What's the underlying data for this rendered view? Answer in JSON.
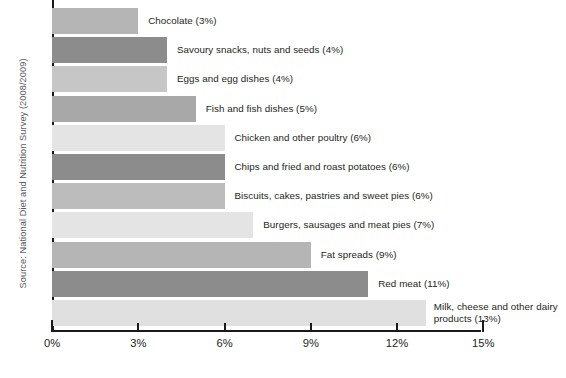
{
  "source_note": "Source: National Diet and Nutrition Survey (2008/2009)",
  "axis": {
    "tick_labels": [
      "0%",
      "3%",
      "6%",
      "9%",
      "12%",
      "15%"
    ]
  },
  "colors": {
    "bar_light": "#e8e8e8",
    "bar_medium": "#b5b5b5",
    "bar_dark": "#8c8c8c",
    "axis": "#1a1a1a",
    "text": "#231f20",
    "source_text": "#58595b",
    "background": "#ffffff"
  },
  "chart_data": {
    "type": "bar",
    "title": "",
    "subtitle": "",
    "xlabel": "",
    "ylabel": "",
    "orientation": "horizontal",
    "xlim": [
      0,
      15
    ],
    "grid": false,
    "legend": false,
    "tick_values": [
      0,
      3,
      6,
      9,
      12,
      15
    ],
    "tick_labels": [
      "0%",
      "3%",
      "6%",
      "9%",
      "12%",
      "15%"
    ],
    "categories": [
      "Chocolate",
      "Savoury snacks, nuts and seeds",
      "Eggs and egg dishes",
      "Fish and fish dishes",
      "Chicken and other poultry",
      "Chips and fried and roast potatoes",
      "Biscuits, cakes, pastries and sweet pies",
      "Burgers, sausages and meat pies",
      "Fat spreads",
      "Red meat",
      "Milk, cheese and other dairy products"
    ],
    "values": [
      3,
      4,
      4,
      5,
      6,
      6,
      6,
      7,
      9,
      11,
      13
    ],
    "bars": [
      {
        "label": "Chocolate (3%)",
        "value": 3,
        "color": "#b5b5b5"
      },
      {
        "label": "Savoury snacks, nuts and seeds (4%)",
        "value": 4,
        "color": "#8c8c8c"
      },
      {
        "label": "Eggs and egg dishes (4%)",
        "value": 4,
        "color": "#c6c6c6"
      },
      {
        "label": "Fish and fish dishes (5%)",
        "value": 5,
        "color": "#a8a8a8"
      },
      {
        "label": "Chicken and other poultry (6%)",
        "value": 6,
        "color": "#e4e4e4"
      },
      {
        "label": "Chips and fried and roast potatoes (6%)",
        "value": 6,
        "color": "#8c8c8c"
      },
      {
        "label": "Biscuits, cakes, pastries and sweet pies (6%)",
        "value": 6,
        "color": "#bcbcbc"
      },
      {
        "label": "Burgers, sausages and meat pies (7%)",
        "value": 7,
        "color": "#e4e4e4"
      },
      {
        "label": "Fat spreads (9%)",
        "value": 9,
        "color": "#b5b5b5"
      },
      {
        "label": "Red meat (11%)",
        "value": 11,
        "color": "#8c8c8c"
      },
      {
        "label": "Milk, cheese and other dairy products (13%)",
        "value": 13,
        "color": "#e0e0e0"
      }
    ]
  }
}
